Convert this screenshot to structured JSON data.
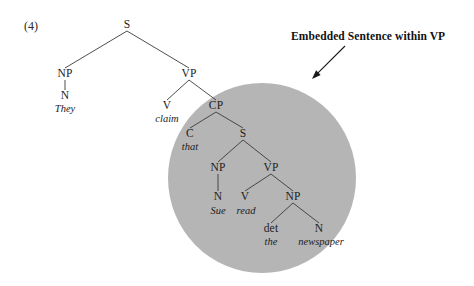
{
  "figure": {
    "example_number": "(4)",
    "annotation": "Embedded Sentence within VP",
    "highlight_color": "#b5b5b5",
    "line_color": "#3a3a3a",
    "background_color": "#ffffff"
  },
  "tree": {
    "nodes": [
      {
        "id": "S-root",
        "label": "S",
        "x": 127,
        "y": 25,
        "kind": "category"
      },
      {
        "id": "NP-subj",
        "label": "NP",
        "x": 65,
        "y": 74,
        "kind": "category"
      },
      {
        "id": "N-subj",
        "label": "N",
        "x": 65,
        "y": 96,
        "kind": "category"
      },
      {
        "id": "VP-main",
        "label": "VP",
        "x": 189,
        "y": 74,
        "kind": "category"
      },
      {
        "id": "V-main",
        "label": "V",
        "x": 167,
        "y": 106,
        "kind": "category"
      },
      {
        "id": "CP",
        "label": "CP",
        "x": 216,
        "y": 106,
        "kind": "category"
      },
      {
        "id": "C",
        "label": "C",
        "x": 190,
        "y": 134,
        "kind": "category"
      },
      {
        "id": "S-emb",
        "label": "S",
        "x": 243,
        "y": 134,
        "kind": "category"
      },
      {
        "id": "NP-emb",
        "label": "NP",
        "x": 218,
        "y": 168,
        "kind": "category"
      },
      {
        "id": "N-emb",
        "label": "N",
        "x": 218,
        "y": 197,
        "kind": "category"
      },
      {
        "id": "VP-emb",
        "label": "VP",
        "x": 271,
        "y": 168,
        "kind": "category"
      },
      {
        "id": "V-emb",
        "label": "V",
        "x": 245,
        "y": 197,
        "kind": "category"
      },
      {
        "id": "NP-obj",
        "label": "NP",
        "x": 293,
        "y": 197,
        "kind": "category"
      },
      {
        "id": "det",
        "label": "det",
        "x": 271,
        "y": 229,
        "kind": "category"
      },
      {
        "id": "N-obj",
        "label": "N",
        "x": 319,
        "y": 229,
        "kind": "category"
      }
    ],
    "words": [
      {
        "id": "w-they",
        "label": "They",
        "x": 65,
        "y": 109
      },
      {
        "id": "w-claim",
        "label": "claim",
        "x": 167,
        "y": 119
      },
      {
        "id": "w-that",
        "label": "that",
        "x": 190,
        "y": 147
      },
      {
        "id": "w-sue",
        "label": "Sue",
        "x": 218,
        "y": 211
      },
      {
        "id": "w-read",
        "label": "read",
        "x": 246,
        "y": 211
      },
      {
        "id": "w-the",
        "label": "the",
        "x": 271,
        "y": 242
      },
      {
        "id": "w-newspaper",
        "label": "newspaper",
        "x": 321,
        "y": 242
      }
    ],
    "edges": [
      {
        "from": "S-root",
        "to": "NP-subj"
      },
      {
        "from": "S-root",
        "to": "VP-main"
      },
      {
        "from": "NP-subj",
        "to": "N-subj"
      },
      {
        "from": "VP-main",
        "to": "V-main"
      },
      {
        "from": "VP-main",
        "to": "CP"
      },
      {
        "from": "CP",
        "to": "C"
      },
      {
        "from": "CP",
        "to": "S-emb"
      },
      {
        "from": "S-emb",
        "to": "NP-emb"
      },
      {
        "from": "S-emb",
        "to": "VP-emb"
      },
      {
        "from": "NP-emb",
        "to": "N-emb"
      },
      {
        "from": "VP-emb",
        "to": "V-emb"
      },
      {
        "from": "VP-emb",
        "to": "NP-obj"
      },
      {
        "from": "NP-obj",
        "to": "det"
      },
      {
        "from": "NP-obj",
        "to": "N-obj"
      }
    ],
    "highlight_ellipse": {
      "cx": 262,
      "cy": 178,
      "rx": 94,
      "ry": 95
    },
    "arrow": {
      "x1": 345,
      "y1": 46,
      "x2": 312,
      "y2": 79
    }
  }
}
